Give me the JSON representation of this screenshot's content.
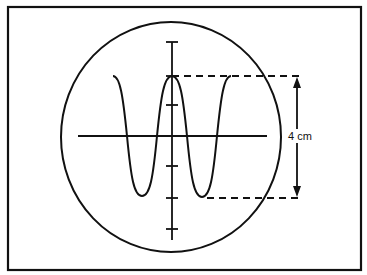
{
  "diagram": {
    "amplitude_label": "4 cm",
    "colors": {
      "stroke": "#111111",
      "background": "#ffffff"
    },
    "axes": {
      "horizontal": true,
      "vertical": true,
      "vertical_tick_count": 6
    },
    "waveform": {
      "type": "sine-like",
      "peaks": 2,
      "troughs": 2,
      "peak_to_peak": "4 cm"
    }
  }
}
